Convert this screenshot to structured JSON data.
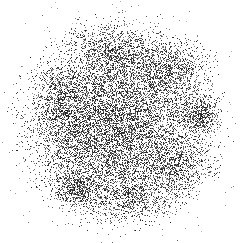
{
  "image": {
    "kind": "nuclear-medicine-scintigram",
    "modality_label": "Scintigraphy dot-density scan",
    "width": 242,
    "height": 243,
    "background_color": "#ffffff",
    "dot_color": "#1a1a1a",
    "rendering": "monochrome stochastic dot density, no text overlay, no grid, no scale bar",
    "caption": "",
    "labels": []
  },
  "chart_data": {
    "type": "heatmap",
    "title": "",
    "subtitle": "",
    "xlabel": "",
    "ylabel": "",
    "legend_position": "none",
    "grid": false,
    "xlim": [
      0,
      242
    ],
    "ylim": [
      0,
      243
    ],
    "colormap": "grayscale-inverted",
    "value_units": "relative counts (dot density)",
    "background_value": 0.0,
    "field": {
      "shape": "ellipse",
      "center_x": 118,
      "center_y": 122,
      "radius_x": 95,
      "radius_y": 97,
      "edge_softness": 0.42,
      "base_intensity": 0.52,
      "description": "Broad roughly circular region of diffuse tracer uptake with soft feathered margins"
    },
    "regions": [
      {
        "name": "focal-hot-spot-right",
        "kind": "focal",
        "center_x": 200,
        "center_y": 115,
        "radius_x": 15,
        "radius_y": 14,
        "intensity": 0.96,
        "falloff": 0.55,
        "description": "Intense well-circumscribed focus at right lateral margin"
      },
      {
        "name": "focal-hot-spot-lower-left",
        "kind": "focal",
        "center_x": 74,
        "center_y": 190,
        "radius_x": 16,
        "radius_y": 14,
        "intensity": 0.88,
        "falloff": 0.6,
        "description": "Dense focus at inferior left quadrant"
      },
      {
        "name": "patch-upper-right",
        "kind": "diffuse",
        "center_x": 173,
        "center_y": 68,
        "radius_x": 26,
        "radius_y": 20,
        "intensity": 0.7,
        "falloff": 0.85,
        "description": "Moderately increased uptake superolateral right"
      },
      {
        "name": "patch-superior-band",
        "kind": "diffuse",
        "center_x": 114,
        "center_y": 50,
        "radius_x": 28,
        "radius_y": 16,
        "intensity": 0.62,
        "falloff": 0.95,
        "description": "Horizontal band of mildly increased uptake at superior pole"
      },
      {
        "name": "patch-left-band",
        "kind": "diffuse",
        "center_x": 63,
        "center_y": 100,
        "radius_x": 17,
        "radius_y": 32,
        "intensity": 0.6,
        "falloff": 1.0,
        "description": "Vertical band of mild uptake along left margin"
      },
      {
        "name": "patch-right-inferior",
        "kind": "diffuse",
        "center_x": 180,
        "center_y": 166,
        "radius_x": 24,
        "radius_y": 18,
        "intensity": 0.72,
        "falloff": 0.8,
        "description": "Patchy increased uptake inferolateral right"
      },
      {
        "name": "patch-inferior-central",
        "kind": "diffuse",
        "center_x": 133,
        "center_y": 198,
        "radius_x": 32,
        "radius_y": 15,
        "intensity": 0.66,
        "falloff": 0.9,
        "description": "Broad band of increased uptake across inferior central field"
      },
      {
        "name": "patch-central",
        "kind": "diffuse",
        "center_x": 108,
        "center_y": 128,
        "radius_x": 40,
        "radius_y": 38,
        "intensity": 0.5,
        "falloff": 1.1,
        "description": "Homogeneous background uptake through central field"
      },
      {
        "name": "cold-area-upper-left",
        "kind": "cold",
        "center_x": 72,
        "center_y": 62,
        "radius_x": 18,
        "radius_y": 16,
        "intensity": -0.18,
        "falloff": 1.0,
        "description": "Relative photopenia superolateral left"
      },
      {
        "name": "cold-area-right-mid",
        "kind": "cold",
        "center_x": 152,
        "center_y": 128,
        "radius_x": 17,
        "radius_y": 17,
        "intensity": -0.14,
        "falloff": 1.0,
        "description": "Relative photopenia right mid-field"
      }
    ],
    "speckle": {
      "total_dots_approx": 52000,
      "dot_size_px": 1,
      "noise_seed": 20240517,
      "stray_dot_fraction": 0.035,
      "stray_dot_radius": 118
    }
  }
}
